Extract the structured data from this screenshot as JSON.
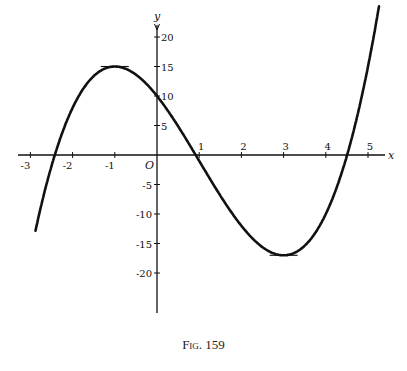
{
  "caption": "Fig. 159",
  "chart_data": {
    "type": "line",
    "title": "",
    "caption": "Fig. 159",
    "function": "y = x^3 - 3x^2 - 9x + 10",
    "xlabel": "x",
    "ylabel": "y",
    "origin_label": "O",
    "xlim": [
      -3.2,
      5.4
    ],
    "ylim": [
      -21,
      21
    ],
    "x_ticks": [
      -3,
      -2,
      -1,
      1,
      2,
      3,
      4,
      5
    ],
    "x_tick_labels": [
      "-3",
      "-2",
      "-1",
      "1",
      "2",
      "3",
      "4",
      "5"
    ],
    "y_ticks": [
      20,
      15,
      10,
      5,
      -5,
      -10,
      -15,
      -20
    ],
    "y_tick_labels": [
      "20",
      "15",
      "10",
      "5",
      "-5",
      "-10",
      "-15",
      "-20"
    ],
    "grid": false,
    "legend": null,
    "key_points": [
      {
        "x": -1,
        "y": 15,
        "label": "local maximum"
      },
      {
        "x": 0,
        "y": 10,
        "label": "y-intercept"
      },
      {
        "x": 3,
        "y": -17,
        "label": "local minimum"
      },
      {
        "x": 1,
        "y": -1
      }
    ],
    "tangent_segments": [
      {
        "x": -1,
        "y": 15,
        "slope": 0
      },
      {
        "x": 3,
        "y": -17,
        "slope": 0
      }
    ],
    "series": [
      {
        "name": "y = x^3 - 3x^2 - 9x + 10",
        "x": [
          -2.9,
          -2.5,
          -2,
          -1.5,
          -1,
          -0.5,
          0,
          0.5,
          1,
          1.5,
          2,
          2.5,
          3,
          3.5,
          4,
          4.5,
          5,
          5.25
        ],
        "values": [
          -20.7,
          3.1,
          8,
          13.6,
          15,
          13.6,
          10,
          4.9,
          -1,
          -6.9,
          -12,
          -15.6,
          -17,
          -15.6,
          -10,
          -0.9,
          15,
          23.6
        ]
      }
    ]
  }
}
